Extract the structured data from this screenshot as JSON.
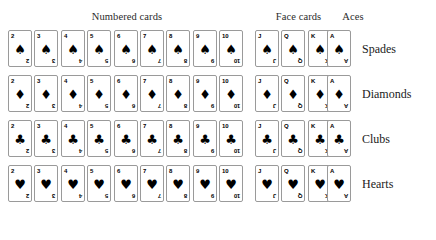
{
  "figure": {
    "background_color": "#ffffff",
    "ink_color": "#000000",
    "card_border_color": "#9a9a9a"
  },
  "headers": {
    "numbered": "Numbered cards",
    "face": "Face cards",
    "aces": "Aces"
  },
  "suits": [
    {
      "name": "Spades",
      "label": "Spades",
      "glyph": "♠"
    },
    {
      "name": "Diamonds",
      "label": "Diamonds",
      "glyph": "♦"
    },
    {
      "name": "Clubs",
      "label": "Clubs",
      "glyph": "♣"
    },
    {
      "name": "Hearts",
      "label": "Hearts",
      "glyph": "♥"
    }
  ],
  "groups": {
    "numbered": [
      "2",
      "3",
      "4",
      "5",
      "6",
      "7",
      "8",
      "9",
      "10"
    ],
    "face": [
      "J",
      "Q",
      "K"
    ],
    "aces": [
      "A"
    ]
  },
  "ranks_in_order": [
    "2",
    "3",
    "4",
    "5",
    "6",
    "7",
    "8",
    "9",
    "10",
    "J",
    "Q",
    "K",
    "A"
  ],
  "layout": {
    "card_width": 24,
    "card_height": 37,
    "numbered_start_x": 8,
    "numbered_step_x": 26.4,
    "face_start_x": 255,
    "face_step_x": 26.4,
    "aces_start_x": 327,
    "row_tops": [
      30,
      75,
      120,
      165
    ],
    "row_label_x": 362
  },
  "counts": {
    "suits": 4,
    "ranks_per_suit": 13,
    "numbered_per_suit": 9,
    "face_per_suit": 3,
    "aces_per_suit": 1,
    "total_cards": 52
  }
}
